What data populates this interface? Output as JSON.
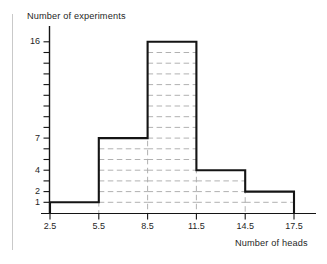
{
  "chart_data": {
    "type": "bar",
    "title": "",
    "subtitle": "",
    "xlabel": "Number of heads",
    "ylabel": "Number of experiments",
    "style": "histogram-outline",
    "bin_edges": [
      2.5,
      5.5,
      8.5,
      11.5,
      14.5,
      17.5
    ],
    "categories": [
      "2.5-5.5",
      "5.5-8.5",
      "8.5-11.5",
      "11.5-14.5",
      "14.5-17.5"
    ],
    "values": [
      1,
      7,
      16,
      4,
      2
    ],
    "xtick_labels": [
      "2.5",
      "5.5",
      "8.5",
      "11.5",
      "14.5",
      "17.5"
    ],
    "ytick_labels": [
      "16",
      "7",
      "4",
      "2",
      "1"
    ],
    "ytick_values": [
      16,
      7,
      4,
      2,
      1
    ],
    "yminor_ticks": [
      1,
      2,
      3,
      4,
      5,
      6,
      7,
      8,
      9,
      10,
      11,
      12,
      13,
      14,
      15,
      16
    ],
    "xlim": [
      2.5,
      17.5
    ],
    "ylim": [
      0,
      16
    ],
    "grid": "dashed-horizontal-and-vertical",
    "legend": "none",
    "colors": {
      "outline": "#141414",
      "grid": "#a8a8a8",
      "axis": "#141414",
      "background": "#ffffff",
      "page_rule": "#c9c9c9"
    }
  }
}
